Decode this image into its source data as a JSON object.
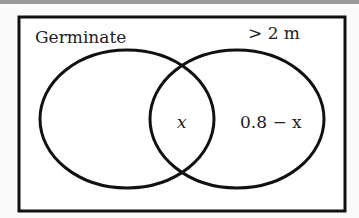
{
  "diagram": {
    "type": "venn",
    "sets": [
      {
        "name": "Germinate",
        "label": "Germinate"
      },
      {
        "name": ">2m",
        "label": "> 2 m"
      }
    ],
    "regions": {
      "intersection": "x",
      "right_only": "0.8 − x",
      "left_only": ""
    }
  }
}
